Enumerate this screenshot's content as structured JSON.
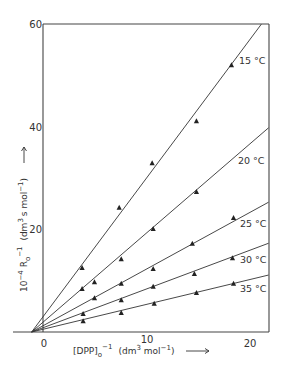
{
  "chart_data": {
    "type": "scatter",
    "title": "",
    "xlabel": "[DPP]o^-1 (dm^3 mol^-1)",
    "ylabel": "10^-4 Ro^-1 (dm^3 s mol^-1)",
    "xlim": [
      -3,
      21.8
    ],
    "ylim": [
      0,
      60
    ],
    "xticks": [
      0,
      10,
      20
    ],
    "yticks": [
      20,
      40,
      60
    ],
    "grid": false,
    "legend": "inline labels at right end of each line",
    "fit_lines_converge_at": [
      -1.2,
      0
    ],
    "series": [
      {
        "name": "15 °C",
        "label": "15 °C",
        "x": [
          3.7,
          7.3,
          10.5,
          14.8,
          18.2
        ],
        "y": [
          12.5,
          24.2,
          32.9,
          41.1,
          52.0
        ],
        "fit_line": [
          [
            -1.2,
            0
          ],
          [
            21.1,
            60
          ]
        ]
      },
      {
        "name": "20 °C",
        "label": "20 °C",
        "x": [
          3.7,
          4.9,
          7.5,
          10.6,
          14.8
        ],
        "y": [
          8.4,
          9.7,
          14.2,
          20.1,
          27.3
        ],
        "fit_line": [
          [
            -1.2,
            0
          ],
          [
            21.8,
            39.8
          ]
        ]
      },
      {
        "name": "25 °C",
        "label": "25 °C",
        "x": [
          4.9,
          7.5,
          10.6,
          14.4,
          18.4
        ],
        "y": [
          6.6,
          9.4,
          12.3,
          17.2,
          22.2
        ],
        "fit_line": [
          [
            -1.2,
            0
          ],
          [
            21.8,
            25.3
          ]
        ]
      },
      {
        "name": "30 °C",
        "label": "30 °C",
        "x": [
          3.8,
          7.5,
          10.6,
          14.6,
          18.3
        ],
        "y": [
          3.5,
          6.2,
          8.8,
          11.3,
          14.4
        ],
        "fit_line": [
          [
            -1.2,
            0
          ],
          [
            21.8,
            17.3
          ]
        ]
      },
      {
        "name": "35 °C",
        "label": "35 °C",
        "x": [
          3.8,
          7.5,
          10.7,
          14.8,
          18.4
        ],
        "y": [
          2.1,
          3.7,
          5.5,
          7.6,
          9.4
        ],
        "fit_line": [
          [
            -1.2,
            0
          ],
          [
            21.8,
            11.1
          ]
        ]
      }
    ],
    "series_label_positions": [
      {
        "x": 239,
        "y": 64
      },
      {
        "x": 238,
        "y": 164
      },
      {
        "x": 240,
        "y": 227
      },
      {
        "x": 240,
        "y": 263
      },
      {
        "x": 240,
        "y": 292
      }
    ]
  },
  "axes": {
    "x_title_main": "[DPP]",
    "x_title_sub": "o",
    "x_title_sup": "−1",
    "x_title_units": "(dm",
    "x_title_units_sup": "3",
    "x_title_units_rest": " mol",
    "x_title_units_sup2": "−1",
    "x_title_units_close": ")",
    "y_title_prefix": "10",
    "y_title_prefix_sup": "−4",
    "y_title_main": " R",
    "y_title_sub": "o",
    "y_title_sup": "−1",
    "y_title_units": " (dm",
    "y_title_units_sup": "3",
    "y_title_units_rest": "s mol",
    "y_title_units_sup2": "−1",
    "y_title_units_close": ")"
  }
}
